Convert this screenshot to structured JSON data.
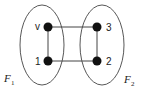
{
  "diagram": {
    "type": "graph",
    "colors": {
      "stroke": "#444444",
      "node": "#111111",
      "background": "#ffffff"
    },
    "groups": [
      {
        "id": "F1",
        "label": "F",
        "subscript": "1",
        "cx": 42,
        "cy": 45,
        "rx": 22,
        "ry": 40
      },
      {
        "id": "F2",
        "label": "F",
        "subscript": "2",
        "cx": 102,
        "cy": 45,
        "rx": 22,
        "ry": 40
      }
    ],
    "nodes": [
      {
        "id": "v",
        "label": "v",
        "x": 48,
        "y": 27,
        "group": "F1",
        "label_side": "left"
      },
      {
        "id": "1",
        "label": "1",
        "x": 48,
        "y": 61,
        "group": "F1",
        "label_side": "left"
      },
      {
        "id": "3",
        "label": "3",
        "x": 97,
        "y": 27,
        "group": "F2",
        "label_side": "right"
      },
      {
        "id": "2",
        "label": "2",
        "x": 97,
        "y": 61,
        "group": "F2",
        "label_side": "right"
      }
    ],
    "edges": [
      {
        "from": "v",
        "to": "1"
      },
      {
        "from": "v",
        "to": "3"
      },
      {
        "from": "1",
        "to": "2"
      },
      {
        "from": "3",
        "to": "2"
      }
    ]
  }
}
